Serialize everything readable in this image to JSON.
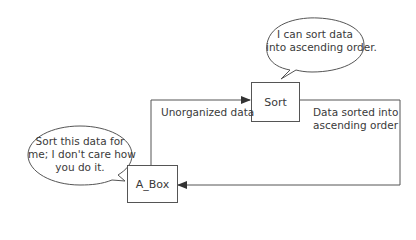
{
  "diagram": {
    "nodes": {
      "sort": {
        "label": "Sort"
      },
      "a_box": {
        "label": "A_Box"
      }
    },
    "edges": {
      "to_sort": {
        "label": "Unorganized data"
      },
      "to_a_box": {
        "label_line1": "Data sorted into",
        "label_line2": "ascending order"
      }
    },
    "bubbles": {
      "sort_bubble": {
        "line1": "I can sort data",
        "line2": "into ascending order."
      },
      "a_box_bubble": {
        "line1": "Sort this data for",
        "line2": "me; I don't care how",
        "line3": "you do it."
      }
    },
    "colors": {
      "line": "#555555",
      "text": "#3a3a3a",
      "background": "#ffffff"
    }
  }
}
